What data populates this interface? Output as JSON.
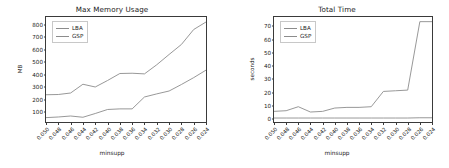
{
  "figure": {
    "width": 449,
    "height": 168,
    "background": "#ffffff"
  },
  "chart_data": [
    {
      "type": "line",
      "title": "Max Memory Usage",
      "xlabel": "minsupp",
      "ylabel": "MB",
      "categories": [
        "0.050",
        "0.048",
        "0.046",
        "0.044",
        "0.042",
        "0.040",
        "0.038",
        "0.036",
        "0.034",
        "0.032",
        "0.030",
        "0.028",
        "0.026",
        "0.024"
      ],
      "yticks": [
        100,
        200,
        300,
        400,
        500,
        600,
        700,
        800
      ],
      "ylim": [
        20,
        860
      ],
      "grid": false,
      "legend_position": "upper left",
      "series": [
        {
          "name": "LBA",
          "color": "#8c8c8c",
          "values": [
            55,
            60,
            68,
            58,
            88,
            120,
            125,
            125,
            220,
            245,
            268,
            320,
            375,
            435
          ]
        },
        {
          "name": "GSP",
          "color": "#8c8c8c",
          "values": [
            238,
            240,
            252,
            322,
            300,
            352,
            408,
            410,
            405,
            478,
            560,
            640,
            760,
            820
          ]
        }
      ]
    },
    {
      "type": "line",
      "title": "Total Time",
      "xlabel": "minsupp",
      "ylabel": "seconds",
      "categories": [
        "0.050",
        "0.048",
        "0.046",
        "0.044",
        "0.042",
        "0.040",
        "0.038",
        "0.036",
        "0.034",
        "0.032",
        "0.030",
        "0.028",
        "0.026",
        "0.024"
      ],
      "yticks": [
        0,
        10,
        20,
        30,
        40,
        50,
        60,
        70
      ],
      "ylim": [
        -2,
        77
      ],
      "grid": false,
      "legend_position": "upper left",
      "series": [
        {
          "name": "LBA",
          "color": "#8c8c8c",
          "values": [
            6,
            6.5,
            9.5,
            5.5,
            6,
            8.5,
            9,
            9,
            9.5,
            21,
            21.5,
            22,
            73.5,
            73.5
          ]
        },
        {
          "name": "GSP",
          "color": "#8c8c8c",
          "values": [
            1,
            1,
            1,
            1,
            1,
            1,
            1,
            1,
            1,
            1,
            1,
            1,
            1.2,
            1.2
          ]
        }
      ]
    }
  ]
}
